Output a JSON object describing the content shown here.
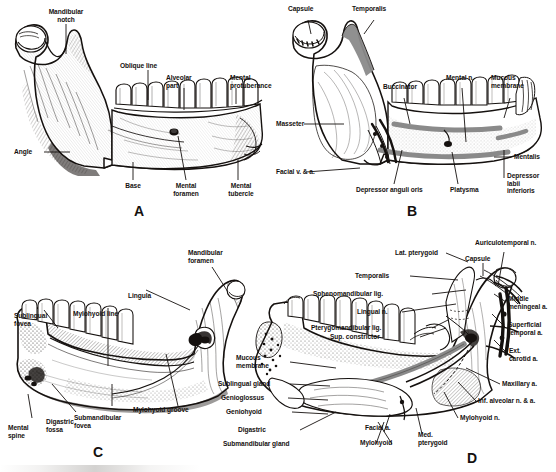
{
  "figure": {
    "type": "anatomical-plate",
    "background_color": "#ffffff",
    "ink_color": "#15110f",
    "highlight_color": "#8a8a8a",
    "panel_count": 4
  },
  "panels": [
    {
      "id": "A",
      "letter": "A",
      "title": "Mandible, lateral view (bone only)",
      "labels": [
        {
          "text": "Mandibular\nnotch",
          "x": 66,
          "y": 8,
          "align": "c"
        },
        {
          "text": "Oblique line",
          "x": 120,
          "y": 62,
          "align": "l"
        },
        {
          "text": "Alveolar\npart",
          "x": 166,
          "y": 74,
          "align": "l"
        },
        {
          "text": "Mental\nprotuberance",
          "x": 230,
          "y": 74,
          "align": "l"
        },
        {
          "text": "Angle",
          "x": 14,
          "y": 152,
          "align": "l"
        },
        {
          "text": "Base",
          "x": 133,
          "y": 186,
          "align": "c"
        },
        {
          "text": "Mental\nforamen",
          "x": 186,
          "y": 186,
          "align": "c"
        },
        {
          "text": "Mental\ntubercle",
          "x": 246,
          "y": 186,
          "align": "c"
        }
      ]
    },
    {
      "id": "B",
      "letter": "B",
      "title": "Mandible, lateral view with muscle attachments and nerves",
      "labels": [
        {
          "text": "Capsule",
          "x": 290,
          "y": 6,
          "align": "l"
        },
        {
          "text": "Temporalis",
          "x": 352,
          "y": 6,
          "align": "l"
        },
        {
          "text": "Buccinator",
          "x": 392,
          "y": 84,
          "align": "l"
        },
        {
          "text": "Mental n.",
          "x": 455,
          "y": 75,
          "align": "l"
        },
        {
          "text": "Mucous\nmembrane",
          "x": 500,
          "y": 75,
          "align": "l"
        },
        {
          "text": "Masseter",
          "x": 277,
          "y": 118,
          "align": "l"
        },
        {
          "text": "Mentalis",
          "x": 514,
          "y": 153,
          "align": "l"
        },
        {
          "text": "Facial v. & a.",
          "x": 277,
          "y": 168,
          "align": "l"
        },
        {
          "text": "Depressor anguli oris",
          "x": 358,
          "y": 188,
          "align": "l"
        },
        {
          "text": "Platysma",
          "x": 452,
          "y": 188,
          "align": "l"
        },
        {
          "text": "Depressor\nlabii\ninferioris",
          "x": 505,
          "y": 172,
          "align": "l"
        }
      ]
    },
    {
      "id": "C",
      "letter": "C",
      "title": "Mandible, medial view (bone only)",
      "labels": [
        {
          "text": "Mandibular\nforamen",
          "x": 188,
          "y": 249,
          "align": "l"
        },
        {
          "text": "Lingula",
          "x": 128,
          "y": 292,
          "align": "l"
        },
        {
          "text": "Mylohyoid line",
          "x": 73,
          "y": 310,
          "align": "l"
        },
        {
          "text": "Sublingual\nfovea",
          "x": 14,
          "y": 312,
          "align": "l"
        },
        {
          "text": "Mylohyoid groove",
          "x": 133,
          "y": 406,
          "align": "l"
        },
        {
          "text": "Submandibular\nfovea",
          "x": 74,
          "y": 414,
          "align": "l"
        },
        {
          "text": "Digastric\nfossa",
          "x": 46,
          "y": 418,
          "align": "l"
        },
        {
          "text": "Mental\nspine",
          "x": 8,
          "y": 425,
          "align": "l"
        }
      ]
    },
    {
      "id": "D",
      "letter": "D",
      "title": "Mandible, medial view with muscles, ligaments, nerves and vessels",
      "labels": [
        {
          "text": "Lat. pterygoid",
          "x": 395,
          "y": 250,
          "align": "l"
        },
        {
          "text": "Capsule",
          "x": 465,
          "y": 256,
          "align": "l"
        },
        {
          "text": "Auriculotemporal n.",
          "x": 475,
          "y": 240,
          "align": "l"
        },
        {
          "text": "Temporalis",
          "x": 355,
          "y": 273,
          "align": "l"
        },
        {
          "text": "Sphenomandibular lig.",
          "x": 313,
          "y": 291,
          "align": "l"
        },
        {
          "text": "Lingual n.",
          "x": 357,
          "y": 309,
          "align": "l"
        },
        {
          "text": "Pterygomandibular lig.",
          "x": 311,
          "y": 325,
          "align": "l"
        },
        {
          "text": "Sup. constrictor",
          "x": 330,
          "y": 334,
          "align": "l"
        },
        {
          "text": "Middle\nmeningeal a.",
          "x": 508,
          "y": 296,
          "align": "l"
        },
        {
          "text": "Superficial\ntemporal a.",
          "x": 508,
          "y": 322,
          "align": "l"
        },
        {
          "text": "Ext.\ncarotid a.",
          "x": 509,
          "y": 348,
          "align": "l"
        },
        {
          "text": "Mucous\nmembrane",
          "x": 236,
          "y": 355,
          "align": "l"
        },
        {
          "text": "Sublingual gland",
          "x": 218,
          "y": 381,
          "align": "l"
        },
        {
          "text": "Genioglossus",
          "x": 221,
          "y": 395,
          "align": "l"
        },
        {
          "text": "Geniohyoid",
          "x": 226,
          "y": 409,
          "align": "l"
        },
        {
          "text": "Maxillary a.",
          "x": 502,
          "y": 381,
          "align": "l"
        },
        {
          "text": "Inf. alveolar n. & a.",
          "x": 478,
          "y": 398,
          "align": "l"
        },
        {
          "text": "Mylohyoid n.",
          "x": 460,
          "y": 415,
          "align": "l"
        },
        {
          "text": "Digastric",
          "x": 238,
          "y": 427,
          "align": "l"
        },
        {
          "text": "Submandibular gland",
          "x": 223,
          "y": 441,
          "align": "l"
        },
        {
          "text": "Facial a.",
          "x": 365,
          "y": 425,
          "align": "l"
        },
        {
          "text": "Mylohyoid",
          "x": 360,
          "y": 440,
          "align": "l"
        },
        {
          "text": "Med.\npterygoid",
          "x": 418,
          "y": 432,
          "align": "l"
        }
      ]
    }
  ]
}
